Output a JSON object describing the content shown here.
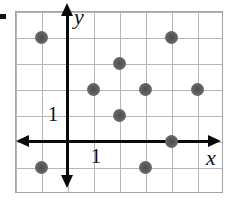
{
  "figure": {
    "description_colors": {
      "dot_color": "#636363",
      "grid_color": "#b6b6b6",
      "axis_color": "#0a0a0a",
      "background": "#ffffff"
    }
  },
  "icons": {
    "corner_dash": "black-dash",
    "x_axis_arrows": "left-right-arrowheads",
    "y_axis_arrows": "up-down-arrowheads"
  },
  "chart_data": {
    "type": "scatter",
    "title": "",
    "xlabel": "x",
    "ylabel": "y",
    "points": [
      {
        "x": -1,
        "y": 4
      },
      {
        "x": 4,
        "y": 4
      },
      {
        "x": 2,
        "y": 3
      },
      {
        "x": 1,
        "y": 2
      },
      {
        "x": 3,
        "y": 2
      },
      {
        "x": 5,
        "y": 2
      },
      {
        "x": 2,
        "y": 1
      },
      {
        "x": 4,
        "y": 0
      },
      {
        "x": -1,
        "y": -1
      },
      {
        "x": 3,
        "y": -1
      }
    ],
    "xlim": [
      -2,
      6
    ],
    "ylim": [
      -2,
      5
    ],
    "grid": true,
    "grid_spacing": 1,
    "x_ticks": [
      {
        "value": 1,
        "label": "1"
      }
    ],
    "y_ticks": [
      {
        "value": 1,
        "label": "1"
      }
    ],
    "legend": null
  }
}
